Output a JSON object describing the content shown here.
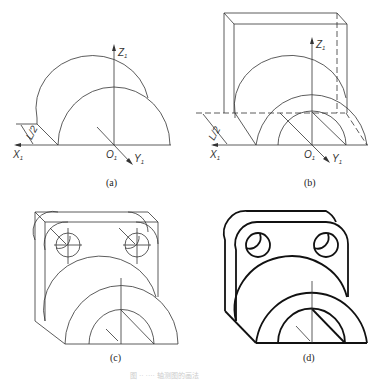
{
  "figure": {
    "panels": [
      {
        "id": "a",
        "label": "(a)",
        "axes": {
          "x": "X",
          "y": "Y",
          "z": "Z",
          "subscript": "1",
          "origin": "O"
        },
        "dimension": "L/2"
      },
      {
        "id": "b",
        "label": "(b)",
        "axes": {
          "x": "X",
          "y": "Y",
          "z": "Z",
          "subscript": "1",
          "origin": "O"
        },
        "dimension": "L/2"
      },
      {
        "id": "c",
        "label": "(c)"
      },
      {
        "id": "d",
        "label": "(d)"
      }
    ],
    "caption": "图 ·· ···· 轴测图的画法"
  },
  "colors": {
    "line": "#333333",
    "outline": "#111111",
    "background": "#ffffff"
  }
}
